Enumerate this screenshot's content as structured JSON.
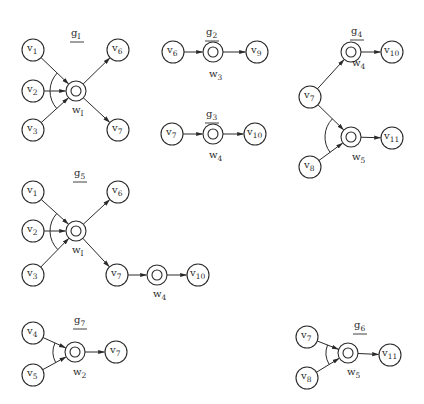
{
  "figure": {
    "width": 424,
    "height": 404,
    "stroke_color": "#2a2a2a",
    "node_radius": 11,
    "junction_outer_radius": 10,
    "junction_inner_radius": 5
  },
  "graphs": [
    {
      "id": "g1",
      "label": {
        "base": "g",
        "sub": "I",
        "x": 71,
        "y": 36
      },
      "nodes": [
        {
          "id": "v1",
          "type": "vertex",
          "base": "v",
          "sub": "1",
          "x": 33,
          "y": 50
        },
        {
          "id": "v2",
          "type": "vertex",
          "base": "v",
          "sub": "2",
          "x": 33,
          "y": 91
        },
        {
          "id": "v3",
          "type": "vertex",
          "base": "v",
          "sub": "3",
          "x": 33,
          "y": 130
        },
        {
          "id": "w1",
          "type": "junction",
          "base": "w",
          "sub": "I",
          "x": 76,
          "y": 91,
          "lx": 72,
          "ly": 113
        },
        {
          "id": "v6",
          "type": "vertex",
          "base": "v",
          "sub": "6",
          "x": 118,
          "y": 50
        },
        {
          "id": "v7",
          "type": "vertex",
          "base": "v",
          "sub": "7",
          "x": 118,
          "y": 130
        }
      ],
      "edges": [
        {
          "from": "v1",
          "to": "w1"
        },
        {
          "from": "v2",
          "to": "w1"
        },
        {
          "from": "v3",
          "to": "w1"
        },
        {
          "from": "w1",
          "to": "v6"
        },
        {
          "from": "w1",
          "to": "v7"
        }
      ],
      "arcs": [
        {
          "junction": "w1",
          "from": "v1",
          "to": "v3",
          "r": 26
        }
      ]
    },
    {
      "id": "g2",
      "label": {
        "base": "g",
        "sub": "2",
        "x": 206,
        "y": 35
      },
      "nodes": [
        {
          "id": "v6",
          "type": "vertex",
          "base": "v",
          "sub": "6",
          "x": 173,
          "y": 52
        },
        {
          "id": "w3",
          "type": "junction",
          "base": "w",
          "sub": "3",
          "x": 213,
          "y": 52,
          "lx": 209,
          "ly": 77
        },
        {
          "id": "v9",
          "type": "vertex",
          "base": "v",
          "sub": "9",
          "x": 257,
          "y": 52
        }
      ],
      "edges": [
        {
          "from": "v6",
          "to": "w3"
        },
        {
          "from": "w3",
          "to": "v9"
        }
      ],
      "arcs": []
    },
    {
      "id": "g3",
      "label": {
        "base": "g",
        "sub": "3",
        "x": 206,
        "y": 117
      },
      "nodes": [
        {
          "id": "v7",
          "type": "vertex",
          "base": "v",
          "sub": "7",
          "x": 172,
          "y": 134
        },
        {
          "id": "w4",
          "type": "junction",
          "base": "w",
          "sub": "4",
          "x": 213,
          "y": 134,
          "lx": 209,
          "ly": 158
        },
        {
          "id": "v10",
          "type": "vertex",
          "base": "v",
          "sub": "10",
          "x": 255,
          "y": 134
        }
      ],
      "edges": [
        {
          "from": "v7",
          "to": "w4"
        },
        {
          "from": "w4",
          "to": "v10"
        }
      ],
      "arcs": []
    },
    {
      "id": "g4",
      "label": {
        "base": "g",
        "sub": "4",
        "x": 351,
        "y": 34
      },
      "nodes": [
        {
          "id": "w4",
          "type": "junction",
          "base": "w",
          "sub": "4",
          "x": 351,
          "y": 52,
          "lx": 352,
          "ly": 66
        },
        {
          "id": "v10",
          "type": "vertex",
          "base": "v",
          "sub": "10",
          "x": 392,
          "y": 52
        },
        {
          "id": "v7",
          "type": "vertex",
          "base": "v",
          "sub": "7",
          "x": 310,
          "y": 97
        },
        {
          "id": "w5",
          "type": "junction",
          "base": "w",
          "sub": "5",
          "x": 351,
          "y": 137,
          "lx": 352,
          "ly": 160
        },
        {
          "id": "v11",
          "type": "vertex",
          "base": "v",
          "sub": "11",
          "x": 392,
          "y": 138
        },
        {
          "id": "v8",
          "type": "vertex",
          "base": "v",
          "sub": "8",
          "x": 310,
          "y": 167
        }
      ],
      "edges": [
        {
          "from": "v7",
          "to": "w4"
        },
        {
          "from": "w4",
          "to": "v10"
        },
        {
          "from": "v7",
          "to": "w5"
        },
        {
          "from": "v8",
          "to": "w5"
        },
        {
          "from": "w5",
          "to": "v11"
        }
      ],
      "arcs": [
        {
          "junction": "w5",
          "from": "v7",
          "to": "v8",
          "r": 26
        }
      ]
    },
    {
      "id": "g5",
      "label": {
        "base": "g",
        "sub": "5",
        "x": 74,
        "y": 176
      },
      "nodes": [
        {
          "id": "v1",
          "type": "vertex",
          "base": "v",
          "sub": "1",
          "x": 33,
          "y": 192
        },
        {
          "id": "v2",
          "type": "vertex",
          "base": "v",
          "sub": "2",
          "x": 33,
          "y": 231
        },
        {
          "id": "v3",
          "type": "vertex",
          "base": "v",
          "sub": "3",
          "x": 33,
          "y": 275
        },
        {
          "id": "w1",
          "type": "junction",
          "base": "w",
          "sub": "I",
          "x": 76,
          "y": 231,
          "lx": 72,
          "ly": 253
        },
        {
          "id": "v6",
          "type": "vertex",
          "base": "v",
          "sub": "6",
          "x": 118,
          "y": 192
        },
        {
          "id": "v7",
          "type": "vertex",
          "base": "v",
          "sub": "7",
          "x": 117,
          "y": 275
        },
        {
          "id": "w4",
          "type": "junction",
          "base": "w",
          "sub": "4",
          "x": 157,
          "y": 275,
          "lx": 153,
          "ly": 297
        },
        {
          "id": "v10",
          "type": "vertex",
          "base": "v",
          "sub": "10",
          "x": 198,
          "y": 275
        }
      ],
      "edges": [
        {
          "from": "v1",
          "to": "w1"
        },
        {
          "from": "v2",
          "to": "w1"
        },
        {
          "from": "v3",
          "to": "w1"
        },
        {
          "from": "w1",
          "to": "v6"
        },
        {
          "from": "w1",
          "to": "v7"
        },
        {
          "from": "v7",
          "to": "w4"
        },
        {
          "from": "w4",
          "to": "v10"
        }
      ],
      "arcs": [
        {
          "junction": "w1",
          "from": "v1",
          "to": "v3",
          "r": 26
        }
      ]
    },
    {
      "id": "g7",
      "label": {
        "base": "g",
        "sub": "7",
        "x": 74,
        "y": 323
      },
      "nodes": [
        {
          "id": "v4",
          "type": "vertex",
          "base": "v",
          "sub": "4",
          "x": 33,
          "y": 333
        },
        {
          "id": "v5",
          "type": "vertex",
          "base": "v",
          "sub": "5",
          "x": 33,
          "y": 375
        },
        {
          "id": "w2",
          "type": "junction",
          "base": "w",
          "sub": "2",
          "x": 75,
          "y": 352,
          "lx": 73,
          "ly": 375
        },
        {
          "id": "v7",
          "type": "vertex",
          "base": "v",
          "sub": "7",
          "x": 116,
          "y": 352
        }
      ],
      "edges": [
        {
          "from": "v4",
          "to": "w2"
        },
        {
          "from": "v5",
          "to": "w2"
        },
        {
          "from": "w2",
          "to": "v7"
        }
      ],
      "arcs": [
        {
          "junction": "w2",
          "from": "v4",
          "to": "v5",
          "r": 22
        }
      ]
    },
    {
      "id": "g6",
      "label": {
        "base": "g",
        "sub": "6",
        "x": 354,
        "y": 328
      },
      "nodes": [
        {
          "id": "v7",
          "type": "vertex",
          "base": "v",
          "sub": "7",
          "x": 307,
          "y": 337
        },
        {
          "id": "v8",
          "type": "vertex",
          "base": "v",
          "sub": "8",
          "x": 307,
          "y": 378
        },
        {
          "id": "w5",
          "type": "junction",
          "base": "w",
          "sub": "5",
          "x": 348,
          "y": 353,
          "lx": 347,
          "ly": 375
        },
        {
          "id": "v11",
          "type": "vertex",
          "base": "v",
          "sub": "11",
          "x": 390,
          "y": 355
        }
      ],
      "edges": [
        {
          "from": "v7",
          "to": "w5"
        },
        {
          "from": "v8",
          "to": "w5"
        },
        {
          "from": "w5",
          "to": "v11"
        }
      ],
      "arcs": [
        {
          "junction": "w5",
          "from": "v7",
          "to": "v8",
          "r": 22
        }
      ]
    }
  ]
}
